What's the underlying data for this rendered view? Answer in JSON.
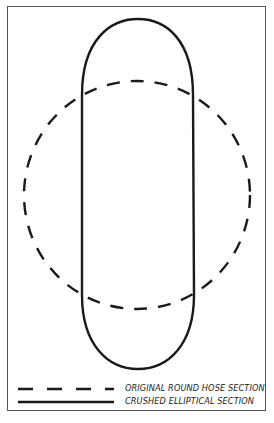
{
  "diagram": {
    "shapes": [
      {
        "id": "original",
        "style": "dashed",
        "description": "Original round hose section",
        "shape": "circle"
      },
      {
        "id": "crushed",
        "style": "solid",
        "description": "Crushed elliptical section",
        "shape": "elongated oval"
      }
    ],
    "colors": {
      "stroke": "#1a1a1a",
      "frame": "#555555",
      "background": "#ffffff"
    }
  },
  "legend": {
    "items": [
      {
        "line": "dashed",
        "label": "ORIGINAL ROUND HOSE SECTION"
      },
      {
        "line": "solid",
        "label": "CRUSHED ELLIPTICAL SECTION"
      }
    ]
  }
}
